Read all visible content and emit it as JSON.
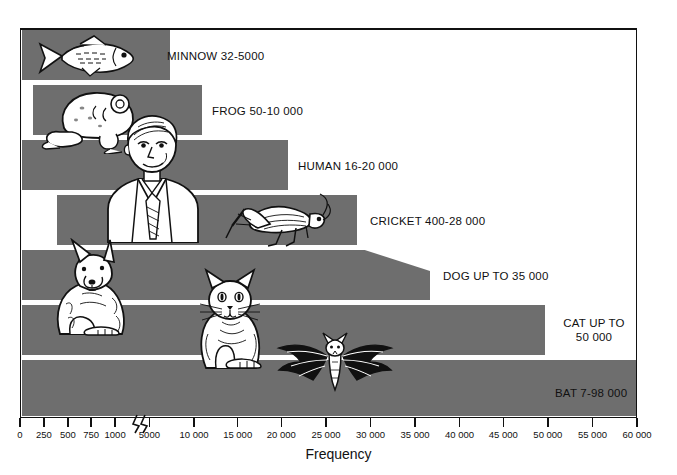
{
  "figure": {
    "axis_title": "Frequency",
    "bar_color": "#6e6e6e",
    "frame_color": "#111111",
    "background": "#ffffff"
  },
  "axis": {
    "ticks": [
      {
        "label": "0",
        "value": 0,
        "x": 20
      },
      {
        "label": "250",
        "value": 250,
        "x": 48
      },
      {
        "label": "500",
        "value": 500,
        "x": 76
      },
      {
        "label": "750",
        "value": 750,
        "x": 103
      },
      {
        "label": "1000",
        "value": 1000,
        "x": 131
      },
      {
        "label": "5000",
        "value": 5000,
        "x": 171
      },
      {
        "label": "10 000",
        "value": 10000,
        "x": 223
      },
      {
        "label": "15 000",
        "value": 15000,
        "x": 274
      },
      {
        "label": "20 000",
        "value": 20000,
        "x": 325
      },
      {
        "label": "25 000",
        "value": 25000,
        "x": 377
      },
      {
        "label": "30 000",
        "value": 30000,
        "x": 429
      },
      {
        "label": "35 000",
        "value": 35000,
        "x": 481
      },
      {
        "label": "40 000",
        "value": 40000,
        "x": 533
      },
      {
        "label": "45 000",
        "value": 45000,
        "x": 584
      },
      {
        "label": "50 000",
        "value": 50000,
        "x": 636
      },
      {
        "label": "55 000",
        "value": 55000,
        "x": 688
      },
      {
        "label": "60 000",
        "value": 60000,
        "x": 740
      }
    ],
    "break_after": 1000,
    "break_symbol": "axis-break-zigzag"
  },
  "chart_data": {
    "type": "bar",
    "orientation": "horizontal",
    "title": "",
    "subtitle": "",
    "xlabel": "Frequency",
    "ylabel": "",
    "grid": false,
    "legend": "none",
    "xlim": [
      0,
      60000
    ],
    "axis_break": "between 1000 and 5000 (scale changes)",
    "note": "Each bar spans the hearing frequency range of the animal, in hertz.",
    "categories": [
      "MINNOW",
      "FROG",
      "HUMAN",
      "CRICKET",
      "DOG",
      "CAT",
      "BAT"
    ],
    "ranges": [
      {
        "name": "MINNOW",
        "low": 32,
        "high": 5000,
        "label": "MINNOW 32-5000"
      },
      {
        "name": "FROG",
        "low": 50,
        "high": 10000,
        "label": "FROG 50-10 000"
      },
      {
        "name": "HUMAN",
        "low": 16,
        "high": 20000,
        "label": "HUMAN 16-20 000"
      },
      {
        "name": "CRICKET",
        "low": 400,
        "high": 28000,
        "label": "CRICKET 400-28 000"
      },
      {
        "name": "DOG",
        "low": 0,
        "high": 35000,
        "label": "DOG UP TO 35 000"
      },
      {
        "name": "CAT",
        "low": 0,
        "high": 50000,
        "label": "CAT UP TO\n50 000"
      },
      {
        "name": "BAT",
        "low": 7,
        "high": 98000,
        "label": "BAT 7-98 000"
      }
    ],
    "values": [
      5000,
      10000,
      20000,
      28000,
      35000,
      50000,
      98000
    ]
  },
  "bars": [
    {
      "id": "minnow",
      "label": "MINNOW 32-5000",
      "rect": {
        "x": 22,
        "y": 30,
        "w": 148,
        "h": 50
      },
      "label_pos": {
        "x": 167,
        "y": 49
      },
      "icon": "minnow-fish-illustration"
    },
    {
      "id": "frog",
      "label": "FROG 50-10 000",
      "rect": {
        "x": 33,
        "y": 85,
        "w": 169,
        "h": 50
      },
      "label_pos": {
        "x": 212,
        "y": 104
      },
      "icon": "frog-illustration"
    },
    {
      "id": "human",
      "label": "HUMAN 16-20 000",
      "rect": {
        "x": 22,
        "y": 140,
        "w": 266,
        "h": 50
      },
      "label_pos": {
        "x": 298,
        "y": 159
      },
      "icon": "human-man-illustration"
    },
    {
      "id": "cricket",
      "label": "CRICKET 400-28 000",
      "rect": {
        "x": 57,
        "y": 195,
        "w": 300,
        "h": 50
      },
      "label_pos": {
        "x": 370,
        "y": 214
      },
      "icon": "cricket-insect-illustration"
    },
    {
      "id": "dog",
      "label": "DOG UP TO 35 000",
      "rect": {
        "x": 22,
        "y": 250,
        "w": 408,
        "h": 50
      },
      "label_pos": {
        "x": 443,
        "y": 269
      },
      "icon": "dog-illustration"
    },
    {
      "id": "cat",
      "label": "CAT UP TO\n50 000",
      "rect": {
        "x": 22,
        "y": 305,
        "w": 523,
        "h": 50
      },
      "label_pos": {
        "x": 556,
        "y": 316
      },
      "icon": "cat-illustration"
    },
    {
      "id": "bat",
      "label": "BAT 7-98 000",
      "rect": {
        "x": 22,
        "y": 360,
        "w": 614,
        "h": 56
      },
      "label_pos": {
        "x": 555,
        "y": 386
      },
      "icon": "bat-illustration"
    }
  ]
}
